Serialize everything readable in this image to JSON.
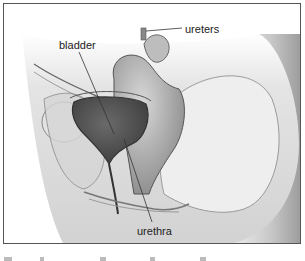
{
  "figure": {
    "labels": {
      "ureters": "ureters",
      "bladder": "bladder",
      "urethra": "urethra"
    }
  }
}
